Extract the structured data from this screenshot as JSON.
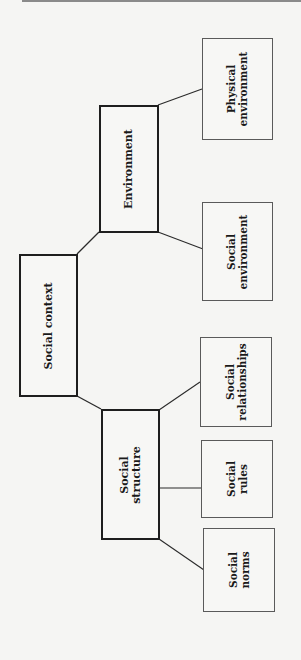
{
  "diagram": {
    "orientation": "rotated-90-ccw",
    "root": {
      "label": "Social context"
    },
    "branches": [
      {
        "label": "Environment",
        "children": [
          {
            "label": "Physical\nenvironment"
          },
          {
            "label": "Social\nenvironment"
          }
        ]
      },
      {
        "label": "Social\nstructure",
        "children": [
          {
            "label": "Social\nrelationships"
          },
          {
            "label": "Social\nrules"
          },
          {
            "label": "Social\nnorms"
          }
        ]
      }
    ],
    "colors": {
      "background": "#f5f5f3",
      "primary_border": "#1e1e1e",
      "leaf_border": "#5a5a5a",
      "connector": "#2a2a2a",
      "text": "#1a1a1a",
      "top_rule": "#8a8a8a"
    }
  }
}
